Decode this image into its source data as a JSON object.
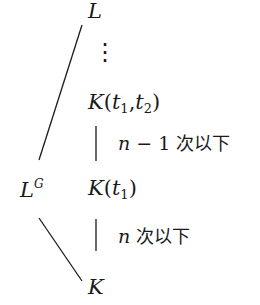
{
  "diagram": {
    "type": "field-extension-lattice",
    "nodes": {
      "L": "L",
      "vdots": "⋮",
      "K_t1_t2": {
        "base": "K",
        "args": [
          "t",
          "1",
          "t",
          "2"
        ]
      },
      "L_G": {
        "base": "L",
        "sup": "G"
      },
      "K_t1": {
        "base": "K",
        "args": [
          "t",
          "1"
        ]
      },
      "K": "K"
    },
    "edges": [
      {
        "from": "L",
        "to": "L_G",
        "style": "diagonal"
      },
      {
        "from": "L_G",
        "to": "K",
        "style": "diagonal"
      },
      {
        "from": "K_t1_t2",
        "to": "K_t1",
        "style": "vertical",
        "label": {
          "var": "n",
          "op": " − 1 ",
          "text": "次以下"
        }
      },
      {
        "from": "K_t1",
        "to": "K",
        "style": "vertical",
        "label": {
          "var": "n",
          "op": " ",
          "text": "次以下"
        }
      }
    ],
    "colors": {
      "ink": "#1a1a1a",
      "background": "#ffffff"
    }
  }
}
